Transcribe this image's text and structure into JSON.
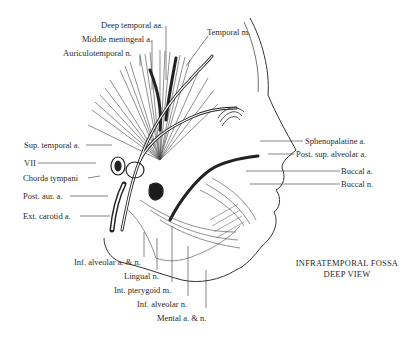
{
  "figure": {
    "title_line1": "INFRATEMPORAL FOSSA",
    "title_line2": "DEEP VIEW"
  },
  "labels": {
    "top": [
      {
        "text": "Deep temporal aa."
      },
      {
        "text": "Middle meningeal a."
      },
      {
        "text": "Auriculotemporal n."
      },
      {
        "text": "Temporal m."
      }
    ],
    "left": [
      {
        "text": "Sup. temporal a."
      },
      {
        "text": "VII"
      },
      {
        "text": "Chorda tympani"
      },
      {
        "text": "Post. aur. a."
      },
      {
        "text": "Ext. carotid a."
      }
    ],
    "right": [
      {
        "text": "Sphenopalatine a."
      },
      {
        "text": "Post. sup. alveolar a."
      },
      {
        "text": "Buccal a."
      },
      {
        "text": "Buccal n."
      }
    ],
    "bottom": [
      {
        "text": "Inf. alveolar a. & n."
      },
      {
        "text": "Lingual n."
      },
      {
        "text": "Int. pterygoid m."
      },
      {
        "text": "Inf. alveolar n."
      },
      {
        "text": "Mental a. & n."
      }
    ]
  },
  "colors": {
    "ink": "#2a2a2a",
    "background": "#ffffff"
  }
}
